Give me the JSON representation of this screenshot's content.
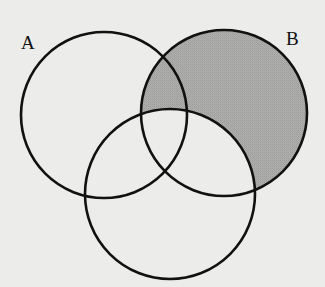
{
  "diagram": {
    "type": "venn",
    "sets": [
      {
        "id": "A",
        "label": "A",
        "cx": 104,
        "cy": 115,
        "r": 83
      },
      {
        "id": "B",
        "label": "B",
        "cx": 224,
        "cy": 113,
        "r": 83
      },
      {
        "id": "C",
        "label": "",
        "cx": 170,
        "cy": 194,
        "r": 85
      }
    ],
    "shaded_region": "B minus C",
    "colors": {
      "background": "#ececea",
      "shading": "#a9a9a7",
      "stroke": "#111111"
    },
    "labels": {
      "a": "A",
      "b": "B"
    }
  }
}
